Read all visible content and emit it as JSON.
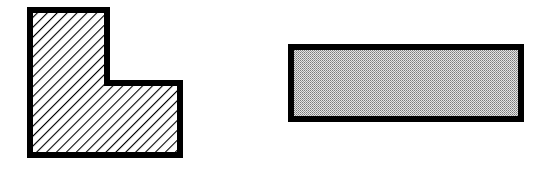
{
  "diagram": {
    "shapes": [
      {
        "id": "l-shape",
        "kind": "L-shaped polygon",
        "fill": "diagonal-hatch",
        "stroke": "#000000",
        "points": [
          [
            30,
            10
          ],
          [
            107,
            10
          ],
          [
            107,
            83
          ],
          [
            180,
            83
          ],
          [
            180,
            155
          ],
          [
            30,
            155
          ]
        ]
      },
      {
        "id": "rectangle",
        "kind": "rectangle",
        "fill": "dotted-gray",
        "stroke": "#000000",
        "x": 291,
        "y": 47,
        "width": 230,
        "height": 72
      }
    ],
    "colors": {
      "stroke": "#000000",
      "hatch": "#000000",
      "dot_dark": "#7a7a7a",
      "dot_light": "#e4e4e4",
      "background": "#ffffff"
    },
    "labels": {
      "l_shape": "L-shaped region (hatched)",
      "rectangle": "Rectangle (dotted gray)"
    }
  }
}
